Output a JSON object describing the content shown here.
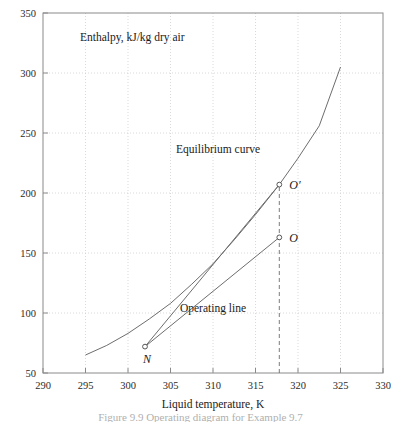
{
  "figure": {
    "caption": "Figure 9.9 Operating diagram for Example 9.7"
  },
  "chart_data": {
    "type": "line",
    "title": "",
    "xlabel": "Liquid temperature, K",
    "ylabel": "Enthalpy, kJ/kg dry air",
    "xlim": [
      290,
      330
    ],
    "ylim": [
      50,
      350
    ],
    "xticks": [
      290,
      295,
      300,
      305,
      310,
      315,
      320,
      325,
      330
    ],
    "yticks": [
      50,
      100,
      150,
      200,
      250,
      300,
      350
    ],
    "grid": true,
    "legend_position": "inline-annotations",
    "line_color": "#6d6d6d",
    "grid_color": "#cfcfcf",
    "axis_color": "#8a8a8a",
    "series": [
      {
        "name": "Equilibrium curve",
        "style": "solid",
        "points": [
          [
            295.0,
            65.0
          ],
          [
            297.5,
            73.0
          ],
          [
            300.0,
            83.0
          ],
          [
            302.5,
            95.0
          ],
          [
            305.0,
            108.0
          ],
          [
            307.5,
            124.0
          ],
          [
            310.0,
            141.0
          ],
          [
            312.5,
            161.0
          ],
          [
            315.0,
            182.0
          ],
          [
            317.8,
            207.0
          ],
          [
            320.0,
            229.0
          ],
          [
            322.5,
            256.0
          ],
          [
            325.0,
            305.0
          ]
        ]
      },
      {
        "name": "Tie line",
        "style": "solid",
        "points": [
          [
            302.0,
            72.0
          ],
          [
            317.8,
            207.0
          ]
        ]
      },
      {
        "name": "Operating line",
        "style": "solid",
        "points": [
          [
            302.0,
            72.0
          ],
          [
            317.8,
            163.0
          ]
        ]
      },
      {
        "name": "Vertical projection",
        "style": "dashed",
        "points": [
          [
            317.8,
            50.0
          ],
          [
            317.8,
            207.0
          ]
        ]
      }
    ],
    "markers": [
      {
        "label": "N",
        "x": 302.0,
        "y": 72.0,
        "label_dx": -2,
        "label_dy": 16
      },
      {
        "label": "O",
        "x": 317.8,
        "y": 163.0,
        "label_dx": 10,
        "label_dy": 5
      },
      {
        "label": "O′",
        "x": 317.8,
        "y": 207.0,
        "label_dx": 10,
        "label_dy": 4
      }
    ],
    "annotations": [
      {
        "text": "Equilibrium curve",
        "x": 310.6,
        "y": 233.0,
        "anchor": "middle"
      },
      {
        "text": "Operating line",
        "x": 310.0,
        "y": 101.0,
        "anchor": "middle"
      },
      {
        "text": "Enthalpy, kJ/kg dry air",
        "x": 300.5,
        "y": 327.0,
        "anchor": "middle"
      }
    ]
  }
}
